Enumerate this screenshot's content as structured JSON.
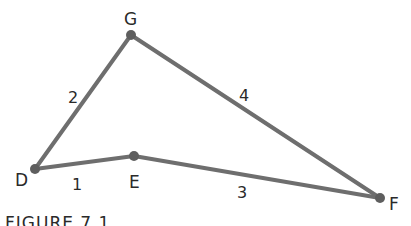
{
  "figure": {
    "caption": "FIGURE 7.1",
    "colors": {
      "edge": "#6e6e6e",
      "vertex": "#5e5e5e",
      "text": "#2a2a2a",
      "background": "#ffffff"
    },
    "vertices": [
      {
        "id": "G",
        "label": "G",
        "x": 131,
        "y": 35,
        "label_x": 124,
        "label_y": 25
      },
      {
        "id": "D",
        "label": "D",
        "x": 35,
        "y": 169,
        "label_x": 15,
        "label_y": 186
      },
      {
        "id": "E",
        "label": "E",
        "x": 134,
        "y": 156,
        "label_x": 129,
        "label_y": 188
      },
      {
        "id": "F",
        "label": "F",
        "x": 380,
        "y": 198,
        "label_x": 389,
        "label_y": 210
      }
    ],
    "edges": [
      {
        "from": "D",
        "to": "E",
        "label": "1",
        "label_x": 72,
        "label_y": 190
      },
      {
        "from": "D",
        "to": "G",
        "label": "2",
        "label_x": 68,
        "label_y": 103
      },
      {
        "from": "E",
        "to": "F",
        "label": "3",
        "label_x": 237,
        "label_y": 198
      },
      {
        "from": "G",
        "to": "F",
        "label": "4",
        "label_x": 239,
        "label_y": 101
      }
    ]
  }
}
